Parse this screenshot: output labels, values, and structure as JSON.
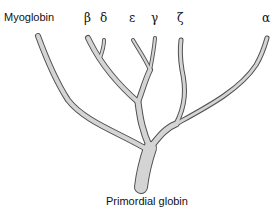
{
  "root_label": "Primordial globin",
  "leaves": [
    {
      "id": "myoglobin",
      "label": "Myoglobin"
    },
    {
      "id": "beta",
      "label": "β"
    },
    {
      "id": "delta",
      "label": "δ"
    },
    {
      "id": "epsilon",
      "label": "ε"
    },
    {
      "id": "gamma",
      "label": "γ"
    },
    {
      "id": "zeta",
      "label": "ζ"
    },
    {
      "id": "alpha",
      "label": "α"
    }
  ],
  "colors": {
    "fill": "#d4d4d4",
    "outline": "#505050",
    "text": "#111111"
  }
}
